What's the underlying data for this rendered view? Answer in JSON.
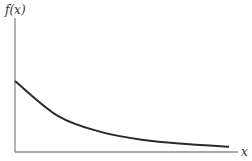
{
  "chart_data": {
    "type": "line",
    "title": "",
    "xlabel": "x",
    "ylabel": "f(x)",
    "grid": false,
    "ticks": false,
    "xlim": [
      0,
      1
    ],
    "ylim": [
      0,
      1
    ],
    "series": [
      {
        "name": "f(x)",
        "description": "decreasing convex curve, positive intercept, approaching zero asymptotically",
        "x": [
          0,
          0.2,
          0.4,
          0.6,
          0.8,
          1.0
        ],
        "y": [
          0.53,
          0.27,
          0.15,
          0.09,
          0.06,
          0.04
        ]
      }
    ]
  }
}
